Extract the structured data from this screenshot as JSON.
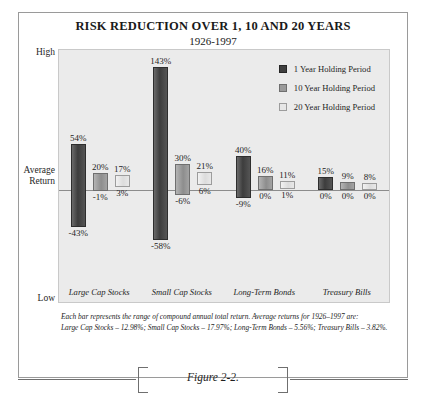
{
  "figure": {
    "title": "RISK REDUCTION OVER 1, 10 AND 20 YEARS",
    "subtitle": "1926-1997",
    "caption": "Figure 2-2.",
    "footnote_line1": "Each bar represents the range of compound annual total return. Average returns for 1926–1997 are:",
    "footnote_line2": "Large Cap Stocks – 12.98%; Small Cap Stocks – 17.97%; Long-Term Bonds – 5.56%; Treasury Bills – 3.82%."
  },
  "axis": {
    "high_label": "High",
    "average_label": "Average\nReturn",
    "average_label_line1": "Average",
    "average_label_line2": "Return",
    "low_label": "Low"
  },
  "legend": {
    "items": [
      {
        "label": "1 Year Holding Period",
        "color": "#3f3f3f",
        "series_index": 0
      },
      {
        "label": "10 Year Holding Period",
        "color": "#9a9a9a",
        "series_index": 1
      },
      {
        "label": "20 Year Holding Period",
        "color": "#e6e6e6",
        "series_index": 2
      }
    ]
  },
  "chart_data": {
    "type": "bar",
    "chart_style": "floating range bars (high-low)",
    "title": "RISK REDUCTION OVER 1, 10 AND 20 YEARS",
    "subtitle": "1926-1997",
    "xlabel": "",
    "ylabel": "Average Return",
    "ylim": [
      -70,
      160
    ],
    "grid": false,
    "zero_line": true,
    "legend_position": "top-right",
    "categories": [
      "Large Cap Stocks",
      "Small Cap Stocks",
      "Long-Term Bonds",
      "Treasury Bills"
    ],
    "series": [
      {
        "name": "1 Year Holding Period",
        "color": "#3f3f3f",
        "high": [
          54,
          143,
          40,
          15
        ],
        "low": [
          -43,
          -58,
          -9,
          0
        ],
        "high_labels": [
          "54%",
          "143%",
          "40%",
          "15%"
        ],
        "low_labels": [
          "-43%",
          "-58%",
          "-9%",
          "0%"
        ]
      },
      {
        "name": "10 Year Holding Period",
        "color": "#9a9a9a",
        "high": [
          20,
          30,
          16,
          9
        ],
        "low": [
          -1,
          -6,
          0,
          0
        ],
        "high_labels": [
          "20%",
          "30%",
          "16%",
          "9%"
        ],
        "low_labels": [
          "-1%",
          "-6%",
          "0%",
          "0%"
        ]
      },
      {
        "name": "20 Year Holding Period",
        "color": "#e6e6e6",
        "high": [
          17,
          21,
          11,
          8
        ],
        "low": [
          3,
          6,
          1,
          0
        ],
        "high_labels": [
          "17%",
          "21%",
          "11%",
          "8%"
        ],
        "low_labels": [
          "3%",
          "6%",
          "1%",
          "0%"
        ]
      }
    ],
    "average_returns": {
      "Large Cap Stocks": "12.98%",
      "Small Cap Stocks": "17.97%",
      "Long-Term Bonds": "5.56%",
      "Treasury Bills": "3.82%"
    }
  }
}
